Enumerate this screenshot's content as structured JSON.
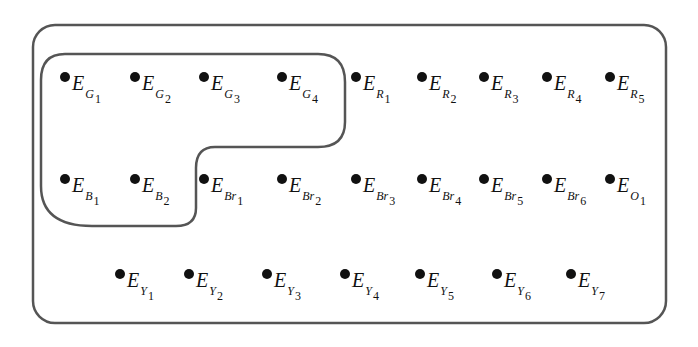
{
  "diagram": {
    "outer_set": {
      "label": "universal-set",
      "stroke": "#555555"
    },
    "inner_set": {
      "label": "subset-G-B",
      "stroke": "#555555"
    },
    "elements": [
      {
        "id": "G1",
        "base": "E",
        "sub": "G",
        "idx": "1",
        "x": 60,
        "y": 69,
        "inner": true
      },
      {
        "id": "G2",
        "base": "E",
        "sub": "G",
        "idx": "2",
        "x": 130,
        "y": 69,
        "inner": true
      },
      {
        "id": "G3",
        "base": "E",
        "sub": "G",
        "idx": "3",
        "x": 199,
        "y": 69,
        "inner": true
      },
      {
        "id": "G4",
        "base": "E",
        "sub": "G",
        "idx": "4",
        "x": 277,
        "y": 69,
        "inner": true
      },
      {
        "id": "R1",
        "base": "E",
        "sub": "R",
        "idx": "1",
        "x": 351,
        "y": 69,
        "inner": false
      },
      {
        "id": "R2",
        "base": "E",
        "sub": "R",
        "idx": "2",
        "x": 417,
        "y": 69,
        "inner": false
      },
      {
        "id": "R3",
        "base": "E",
        "sub": "R",
        "idx": "3",
        "x": 479,
        "y": 69,
        "inner": false
      },
      {
        "id": "R4",
        "base": "E",
        "sub": "R",
        "idx": "4",
        "x": 542,
        "y": 69,
        "inner": false
      },
      {
        "id": "R5",
        "base": "E",
        "sub": "R",
        "idx": "5",
        "x": 605,
        "y": 69,
        "inner": false
      },
      {
        "id": "B1",
        "base": "E",
        "sub": "B",
        "idx": "1",
        "x": 60,
        "y": 171,
        "inner": true
      },
      {
        "id": "B2",
        "base": "E",
        "sub": "B",
        "idx": "2",
        "x": 130,
        "y": 171,
        "inner": true
      },
      {
        "id": "Br1",
        "base": "E",
        "sub": "Br",
        "idx": "1",
        "x": 199,
        "y": 171,
        "inner": false
      },
      {
        "id": "Br2",
        "base": "E",
        "sub": "Br",
        "idx": "2",
        "x": 277,
        "y": 171,
        "inner": false
      },
      {
        "id": "Br3",
        "base": "E",
        "sub": "Br",
        "idx": "3",
        "x": 351,
        "y": 171,
        "inner": false
      },
      {
        "id": "Br4",
        "base": "E",
        "sub": "Br",
        "idx": "4",
        "x": 417,
        "y": 171,
        "inner": false
      },
      {
        "id": "Br5",
        "base": "E",
        "sub": "Br",
        "idx": "5",
        "x": 479,
        "y": 171,
        "inner": false
      },
      {
        "id": "Br6",
        "base": "E",
        "sub": "Br",
        "idx": "6",
        "x": 542,
        "y": 171,
        "inner": false
      },
      {
        "id": "O1",
        "base": "E",
        "sub": "O",
        "idx": "1",
        "x": 605,
        "y": 171,
        "inner": false
      },
      {
        "id": "Y1",
        "base": "E",
        "sub": "Y",
        "idx": "1",
        "x": 115,
        "y": 266,
        "inner": false
      },
      {
        "id": "Y2",
        "base": "E",
        "sub": "Y",
        "idx": "2",
        "x": 184,
        "y": 266,
        "inner": false
      },
      {
        "id": "Y3",
        "base": "E",
        "sub": "Y",
        "idx": "3",
        "x": 262,
        "y": 266,
        "inner": false
      },
      {
        "id": "Y4",
        "base": "E",
        "sub": "Y",
        "idx": "4",
        "x": 340,
        "y": 266,
        "inner": false
      },
      {
        "id": "Y5",
        "base": "E",
        "sub": "Y",
        "idx": "5",
        "x": 415,
        "y": 266,
        "inner": false
      },
      {
        "id": "Y6",
        "base": "E",
        "sub": "Y",
        "idx": "6",
        "x": 492,
        "y": 266,
        "inner": false
      },
      {
        "id": "Y7",
        "base": "E",
        "sub": "Y",
        "idx": "7",
        "x": 566,
        "y": 266,
        "inner": false
      }
    ]
  }
}
